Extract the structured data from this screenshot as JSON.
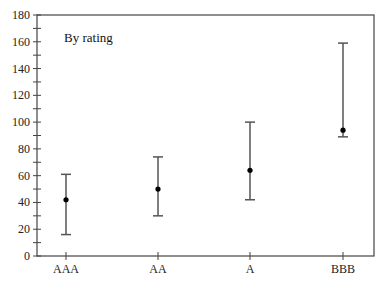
{
  "chart_data": {
    "type": "errorbar",
    "title": "",
    "annotation": "By rating",
    "xlabel": "",
    "ylabel": "",
    "categories": [
      "AAA",
      "AA",
      "A",
      "BBB"
    ],
    "series": [
      {
        "name": "high",
        "values": [
          61,
          74,
          100,
          159
        ]
      },
      {
        "name": "mid",
        "values": [
          42,
          50,
          64,
          94
        ]
      },
      {
        "name": "low",
        "values": [
          16,
          30,
          42,
          89
        ]
      }
    ],
    "ylim": [
      0,
      180
    ],
    "yticks": [
      0,
      20,
      40,
      60,
      80,
      100,
      120,
      140,
      160,
      180
    ],
    "minor_tick_step": 10,
    "grid": false,
    "legend": "none",
    "colors": {
      "line": "#555555",
      "dot": "#000000",
      "axis": "#444444"
    }
  }
}
